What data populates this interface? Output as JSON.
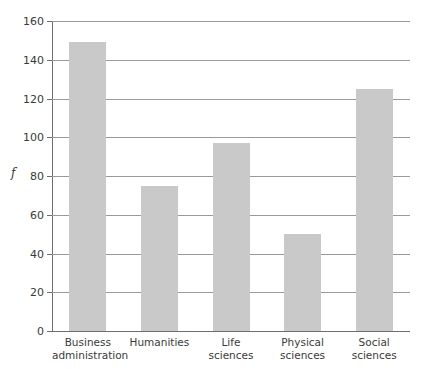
{
  "chart_data": {
    "type": "bar",
    "title": "",
    "xlabel": "",
    "ylabel": "f",
    "categories": [
      "Business administration",
      "Humanities",
      "Life sciences",
      "Physical sciences",
      "Social sciences"
    ],
    "category_lines": [
      [
        "Business",
        "administration"
      ],
      [
        "Humanities"
      ],
      [
        "Life",
        "sciences"
      ],
      [
        "Physical",
        "sciences"
      ],
      [
        "Social",
        "sciences"
      ]
    ],
    "values": [
      149,
      75,
      97,
      50,
      125
    ],
    "ylim": [
      0,
      160
    ],
    "ytick_step": 20,
    "yticks": [
      0,
      20,
      40,
      60,
      80,
      100,
      120,
      140,
      160
    ],
    "ytick_labels": [
      "0",
      "20",
      "40",
      "60",
      "80",
      "100",
      "120",
      "140",
      "160"
    ],
    "grid": true,
    "legend": "none",
    "bar_color": "#c9c9c9",
    "axis_color": "#6e6e6e",
    "grid_color": "#9a9a9a",
    "text_color": "#3a3a3a"
  }
}
